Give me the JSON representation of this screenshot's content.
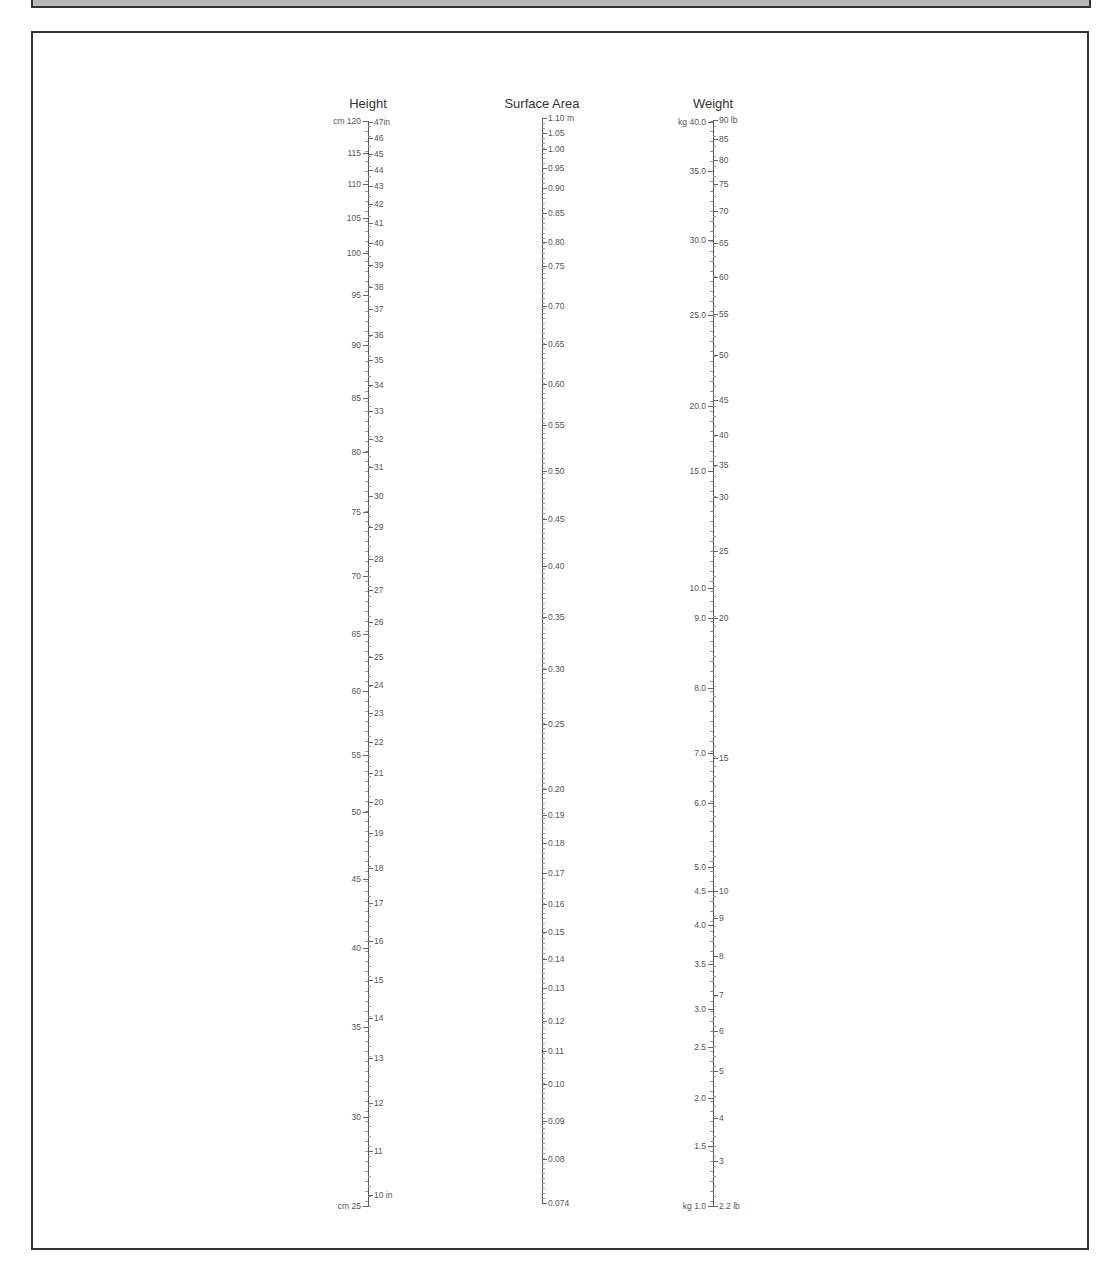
{
  "chart_data": {
    "type": "nomogram",
    "title": "",
    "axes": [
      {
        "name": "Height",
        "x": 368,
        "y_top": 121,
        "y_bottom": 1206,
        "left_unit": "cm",
        "right_unit": "in",
        "left_labels": [
          {
            "v": "cm 120",
            "y": 121
          },
          {
            "v": "115",
            "y": 153
          },
          {
            "v": "110",
            "y": 184
          },
          {
            "v": "105",
            "y": 218
          },
          {
            "v": "100",
            "y": 253
          },
          {
            "v": "95",
            "y": 295
          },
          {
            "v": "90",
            "y": 345
          },
          {
            "v": "85",
            "y": 398
          },
          {
            "v": "80",
            "y": 452
          },
          {
            "v": "75",
            "y": 512
          },
          {
            "v": "70",
            "y": 576
          },
          {
            "v": "65",
            "y": 634
          },
          {
            "v": "60",
            "y": 691
          },
          {
            "v": "55",
            "y": 755
          },
          {
            "v": "50",
            "y": 812
          },
          {
            "v": "45",
            "y": 879
          },
          {
            "v": "40",
            "y": 948
          },
          {
            "v": "35",
            "y": 1027
          },
          {
            "v": "30",
            "y": 1117
          },
          {
            "v": "cm 25",
            "y": 1206
          }
        ],
        "right_labels": [
          {
            "v": "47in",
            "y": 122
          },
          {
            "v": "46",
            "y": 138
          },
          {
            "v": "45",
            "y": 154
          },
          {
            "v": "44",
            "y": 170
          },
          {
            "v": "43",
            "y": 186
          },
          {
            "v": "42",
            "y": 204
          },
          {
            "v": "41",
            "y": 223
          },
          {
            "v": "40",
            "y": 243
          },
          {
            "v": "39",
            "y": 265
          },
          {
            "v": "38",
            "y": 287
          },
          {
            "v": "37",
            "y": 309
          },
          {
            "v": "36",
            "y": 335
          },
          {
            "v": "35",
            "y": 360
          },
          {
            "v": "34",
            "y": 385
          },
          {
            "v": "33",
            "y": 411
          },
          {
            "v": "32",
            "y": 439
          },
          {
            "v": "31",
            "y": 467
          },
          {
            "v": "30",
            "y": 496
          },
          {
            "v": "29",
            "y": 527
          },
          {
            "v": "28",
            "y": 559
          },
          {
            "v": "27",
            "y": 590
          },
          {
            "v": "26",
            "y": 622
          },
          {
            "v": "25",
            "y": 657
          },
          {
            "v": "24",
            "y": 685
          },
          {
            "v": "23",
            "y": 713
          },
          {
            "v": "22",
            "y": 742
          },
          {
            "v": "21",
            "y": 773
          },
          {
            "v": "20",
            "y": 802
          },
          {
            "v": "19",
            "y": 833
          },
          {
            "v": "18",
            "y": 868
          },
          {
            "v": "17",
            "y": 903
          },
          {
            "v": "16",
            "y": 941
          },
          {
            "v": "15",
            "y": 980
          },
          {
            "v": "14",
            "y": 1018
          },
          {
            "v": "13",
            "y": 1058
          },
          {
            "v": "12",
            "y": 1103
          },
          {
            "v": "11",
            "y": 1151
          },
          {
            "v": "10 in",
            "y": 1195
          }
        ]
      },
      {
        "name": "Surface Area",
        "x": 542,
        "y_top": 118,
        "y_bottom": 1203,
        "unit": "m",
        "right_labels": [
          {
            "v": "1.10 m",
            "y": 118
          },
          {
            "v": "1.05",
            "y": 133
          },
          {
            "v": "1.00",
            "y": 149
          },
          {
            "v": "0.95",
            "y": 168
          },
          {
            "v": "0.90",
            "y": 188
          },
          {
            "v": "0.85",
            "y": 213
          },
          {
            "v": "0.80",
            "y": 242
          },
          {
            "v": "0.75",
            "y": 266
          },
          {
            "v": "0.70",
            "y": 306
          },
          {
            "v": "0.65",
            "y": 344
          },
          {
            "v": "0.60",
            "y": 384
          },
          {
            "v": "0.55",
            "y": 425
          },
          {
            "v": "0.50",
            "y": 471
          },
          {
            "v": "0.45",
            "y": 519
          },
          {
            "v": "0.40",
            "y": 566
          },
          {
            "v": "0.35",
            "y": 617
          },
          {
            "v": "0.30",
            "y": 669
          },
          {
            "v": "0.25",
            "y": 724
          },
          {
            "v": "0.20",
            "y": 789
          },
          {
            "v": "0.19",
            "y": 815
          },
          {
            "v": "0.18",
            "y": 843
          },
          {
            "v": "0.17",
            "y": 873
          },
          {
            "v": "0.16",
            "y": 904
          },
          {
            "v": "0.15",
            "y": 932
          },
          {
            "v": "0.14",
            "y": 959
          },
          {
            "v": "0.13",
            "y": 988
          },
          {
            "v": "0.12",
            "y": 1021
          },
          {
            "v": "0.11",
            "y": 1051
          },
          {
            "v": "0.10",
            "y": 1084
          },
          {
            "v": "0.09",
            "y": 1121
          },
          {
            "v": "0.08",
            "y": 1159
          },
          {
            "v": "0.074",
            "y": 1203
          }
        ]
      },
      {
        "name": "Weight",
        "x": 713,
        "y_top": 121,
        "y_bottom": 1206,
        "left_unit": "kg",
        "right_unit": "lb",
        "left_labels": [
          {
            "v": "kg 40.0",
            "y": 122
          },
          {
            "v": "35.0",
            "y": 171
          },
          {
            "v": "30.0",
            "y": 240
          },
          {
            "v": "25.0",
            "y": 315
          },
          {
            "v": "20.0",
            "y": 406
          },
          {
            "v": "15.0",
            "y": 471
          },
          {
            "v": "10.0",
            "y": 588
          },
          {
            "v": "9.0",
            "y": 618
          },
          {
            "v": "8.0",
            "y": 688
          },
          {
            "v": "7.0",
            "y": 753
          },
          {
            "v": "6.0",
            "y": 803
          },
          {
            "v": "5.0",
            "y": 867
          },
          {
            "v": "4.5",
            "y": 891
          },
          {
            "v": "4.0",
            "y": 925
          },
          {
            "v": "3.5",
            "y": 964
          },
          {
            "v": "3.0",
            "y": 1009
          },
          {
            "v": "2.5",
            "y": 1047
          },
          {
            "v": "2.0",
            "y": 1098
          },
          {
            "v": "1.5",
            "y": 1146
          },
          {
            "v": "kg 1.0",
            "y": 1206
          }
        ],
        "right_labels": [
          {
            "v": "90 lb",
            "y": 120
          },
          {
            "v": "85",
            "y": 139
          },
          {
            "v": "80",
            "y": 160
          },
          {
            "v": "75",
            "y": 184
          },
          {
            "v": "70",
            "y": 211
          },
          {
            "v": "65",
            "y": 243
          },
          {
            "v": "60",
            "y": 277
          },
          {
            "v": "55",
            "y": 314
          },
          {
            "v": "50",
            "y": 355
          },
          {
            "v": "45",
            "y": 400
          },
          {
            "v": "40",
            "y": 435
          },
          {
            "v": "35",
            "y": 465
          },
          {
            "v": "30",
            "y": 497
          },
          {
            "v": "25",
            "y": 551
          },
          {
            "v": "20",
            "y": 618
          },
          {
            "v": "15",
            "y": 758
          },
          {
            "v": "10",
            "y": 891
          },
          {
            "v": "9",
            "y": 918
          },
          {
            "v": "8",
            "y": 956
          },
          {
            "v": "7",
            "y": 995
          },
          {
            "v": "6",
            "y": 1031
          },
          {
            "v": "5",
            "y": 1071
          },
          {
            "v": "4",
            "y": 1118
          },
          {
            "v": "3",
            "y": 1161
          },
          {
            "v": "2.2 lb",
            "y": 1206
          }
        ]
      }
    ]
  }
}
